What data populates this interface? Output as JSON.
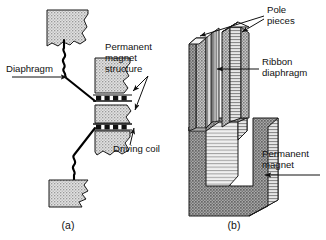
{
  "figure": {
    "background_color": "#ffffff",
    "ink_color": "#111111"
  },
  "panel_a": {
    "caption": "(a)",
    "labels": {
      "diaphragm": "Diaphragm",
      "permanent_magnet_structure_line1": "Permanent",
      "permanent_magnet_structure_line2": "magnet",
      "permanent_magnet_structure_line3": "structure",
      "driving_coil": "Driving coil"
    },
    "parts": [
      "upper-diaphragm-block",
      "lower-diaphragm-block",
      "upper-magnet-block",
      "lower-magnet-block",
      "upper-driving-coil",
      "lower-driving-coil",
      "diaphragm-wire"
    ]
  },
  "panel_b": {
    "caption": "(b)",
    "labels": {
      "pole_pieces_line1": "Pole",
      "pole_pieces_line2": "pieces",
      "ribbon_diaphragm_line1": "Ribbon",
      "ribbon_diaphragm_line2": "diaphragm",
      "permanent_magnet_line1": "Permanent",
      "permanent_magnet_line2": "magnet"
    },
    "parts": [
      "left-pole-piece",
      "right-pole-piece",
      "ribbon-diaphragm-strip",
      "permanent-magnet-yoke"
    ]
  },
  "colors": {
    "stipple_light": "#cfcfcf",
    "stipple_mid": "#b4b4b4",
    "stipple_dark": "#8e8e8e",
    "hatch_line": "#6f6f6f",
    "outline": "#1a1a1a",
    "coil_black": "#111111"
  }
}
